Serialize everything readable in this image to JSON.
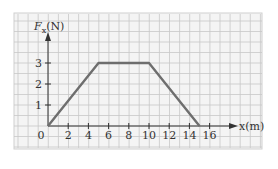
{
  "chart_data": {
    "type": "line",
    "title": "",
    "xlabel": "x(m)",
    "ylabel": "F_x (N)",
    "ylabel_main": "F",
    "ylabel_sub": "x",
    "ylabel_unit": "(N)",
    "x": [
      0,
      5,
      10,
      15
    ],
    "series": [
      {
        "name": "F_x",
        "values": [
          0,
          3,
          3,
          0
        ]
      }
    ],
    "xlim": [
      0,
      17
    ],
    "ylim": [
      0,
      4
    ],
    "xticks": [
      0,
      2,
      4,
      6,
      8,
      10,
      12,
      14,
      16
    ],
    "yticks": [
      1,
      2,
      3
    ],
    "grid": true,
    "colors": {
      "paper": "#f4f4f4",
      "grid": "#c8c8c8",
      "line": "#6e6e6e",
      "axis": "#333333"
    }
  }
}
